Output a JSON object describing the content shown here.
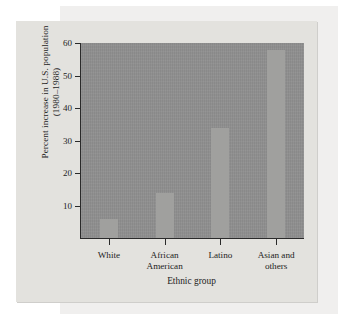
{
  "figure": {
    "y_axis_title_line1": "Percent increase in U.S. population",
    "y_axis_title_line2": "(1980–1988)",
    "x_axis_title": "Ethnic group"
  },
  "colors": {
    "page_background": "#ffffff",
    "card_background": "#e3e2de",
    "backing_panel": "#f0efee",
    "plot_background": "#8e8e8e",
    "bar_fill": "#a0a09e",
    "axis_line": "#2a2a2a",
    "text": "#1d1d1d"
  },
  "chart_data": {
    "type": "bar",
    "title": "",
    "subtitle": "",
    "xlabel": "Ethnic group",
    "ylabel": "Percent increase in U.S. population (1980–1988)",
    "categories": [
      "White",
      "African American",
      "Latino",
      "Asian and others"
    ],
    "category_lines": [
      [
        "White"
      ],
      [
        "African",
        "American"
      ],
      [
        "Latino"
      ],
      [
        "Asian and",
        "others"
      ]
    ],
    "values": [
      6,
      14,
      34,
      58
    ],
    "ylim": [
      0,
      60
    ],
    "yticks": [
      10,
      20,
      30,
      40,
      50,
      60
    ],
    "ytick_labels": [
      "10",
      "20",
      "30",
      "40",
      "50",
      "60"
    ],
    "grid": false,
    "legend": false,
    "legend_position": "none",
    "series": [
      {
        "name": "Percent increase 1980-1988",
        "values": [
          6,
          14,
          34,
          58
        ]
      }
    ]
  }
}
